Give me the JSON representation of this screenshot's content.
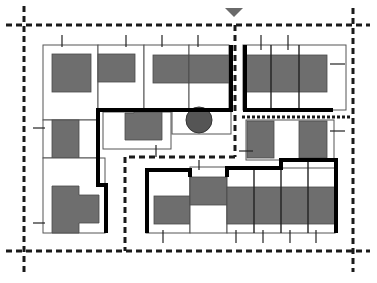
{
  "diagram": {
    "type": "site-plan",
    "colors": {
      "background": "#ffffff",
      "building": "#6e6e6e",
      "road_line": "#1a1a1a",
      "wall": "#000000",
      "tree": "#555555",
      "north_marker": "#6a6a6a"
    },
    "elements": {
      "north_marker": "downward triangle marker",
      "roads": "dashed road center lines",
      "lots": "parcel outlines with gray building footprints",
      "walls": "heavy black boundary walls",
      "tree": "single circular tree",
      "ticks": "entrance tick marks"
    }
  }
}
